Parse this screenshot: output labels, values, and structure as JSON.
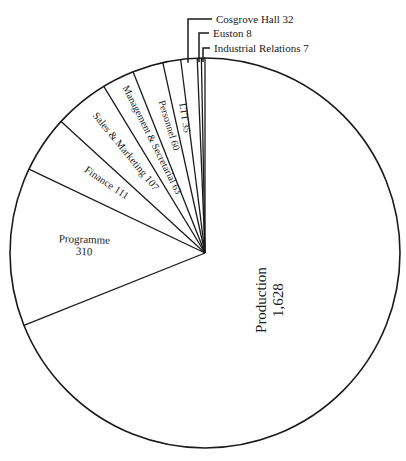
{
  "chart_data": {
    "type": "pie",
    "title": "",
    "start_angle_deg": 0,
    "direction": "clockwise",
    "total": 2361,
    "slices": [
      {
        "label": "Production",
        "value": 1628,
        "value_text": "1,628"
      },
      {
        "label": "Programme",
        "value": 310,
        "value_text": "310"
      },
      {
        "label": "Finance",
        "value": 111,
        "value_text": "111"
      },
      {
        "label": "Sales & Marketing",
        "value": 107,
        "value_text": "107"
      },
      {
        "label": "Management & Secretarial",
        "value": 63,
        "value_text": "63"
      },
      {
        "label": "Personnel",
        "value": 60,
        "value_text": "60"
      },
      {
        "label": "LTT",
        "value": 35,
        "value_text": "35"
      },
      {
        "label": "Cosgrove Hall",
        "value": 32,
        "value_text": "32"
      },
      {
        "label": "Euston",
        "value": 8,
        "value_text": "8"
      },
      {
        "label": "Industrial Relations",
        "value": 7,
        "value_text": "7"
      }
    ],
    "callouts": [
      {
        "label": "Cosgrove Hall",
        "value_text": "32"
      },
      {
        "label": "Euston",
        "value_text": "8"
      },
      {
        "label": "Industrial Relations",
        "value_text": "7"
      }
    ]
  },
  "style": {
    "line_color": "#1a1a1a",
    "fill_color": "#ffffff"
  }
}
